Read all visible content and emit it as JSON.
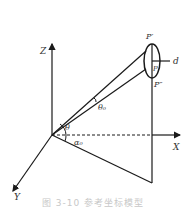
{
  "figure": {
    "labels": {
      "z_axis": "Z",
      "x_axis": "X",
      "y_axis": "Y",
      "p_prime": "P′",
      "p_double_prime": "P″",
      "p": "P",
      "d": "d",
      "theta": "θ",
      "theta_0": "θ₀",
      "alpha_0": "α₀"
    },
    "caption": "图 3-10 参考坐标模型",
    "colors": {
      "stroke": "#1a1a1a",
      "label": "#333333",
      "caption": "#c8c8c8"
    }
  }
}
